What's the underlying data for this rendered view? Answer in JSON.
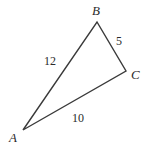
{
  "figure": {
    "type": "triangle-diagram",
    "background_color": "#ffffff",
    "stroke_color": "#3a3a3a",
    "text_color": "#2b2b2b",
    "vertices": [
      {
        "name": "A",
        "label": "A",
        "x": 23,
        "y": 130
      },
      {
        "name": "B",
        "label": "B",
        "x": 97,
        "y": 22
      },
      {
        "name": "C",
        "label": "C",
        "x": 126,
        "y": 71
      }
    ],
    "sides": [
      {
        "name": "AB",
        "label": "12",
        "from": "A",
        "to": "B"
      },
      {
        "name": "BC",
        "label": "5",
        "from": "B",
        "to": "C"
      },
      {
        "name": "AC",
        "label": "10",
        "from": "A",
        "to": "C"
      }
    ]
  }
}
